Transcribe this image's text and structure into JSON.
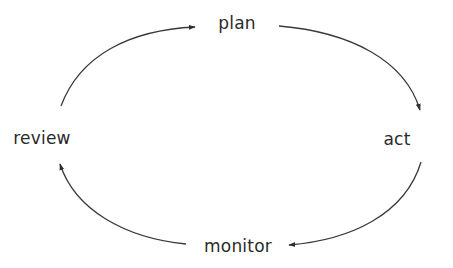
{
  "diagram": {
    "type": "cycle",
    "nodes": [
      {
        "id": "plan",
        "label": "plan",
        "x": 237,
        "y": 23
      },
      {
        "id": "act",
        "label": "act",
        "x": 397,
        "y": 139
      },
      {
        "id": "monitor",
        "label": "monitor",
        "x": 238,
        "y": 246
      },
      {
        "id": "review",
        "label": "review",
        "x": 42,
        "y": 138
      }
    ],
    "edges": [
      {
        "from": "review",
        "to": "plan"
      },
      {
        "from": "plan",
        "to": "act"
      },
      {
        "from": "act",
        "to": "monitor"
      },
      {
        "from": "monitor",
        "to": "review"
      }
    ],
    "colors": {
      "stroke": "#3a3a3a",
      "text": "#2a2a2a",
      "background": "#ffffff"
    }
  }
}
